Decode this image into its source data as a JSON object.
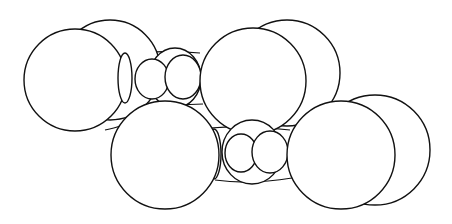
{
  "diagram": {
    "type": "space-filling molecular model (line drawing)",
    "canvas": {
      "width": 452,
      "height": 224,
      "background": "#ffffff",
      "stroke": "#111111"
    },
    "shapes": [
      {
        "id": "top-left-back-sphere",
        "kind": "circle",
        "cx": 110,
        "cy": 70,
        "r": 50
      },
      {
        "id": "top-left-front-sphere",
        "kind": "circle",
        "cx": 75,
        "cy": 80,
        "r": 51
      },
      {
        "id": "top-bridge-back",
        "kind": "ellipse",
        "cx": 175,
        "cy": 78,
        "rx": 26,
        "ry": 30
      },
      {
        "id": "top-ring-ellipse",
        "kind": "ellipse",
        "cx": 125,
        "cy": 78,
        "rx": 7,
        "ry": 25
      },
      {
        "id": "top-small-sphere-1",
        "kind": "ellipse",
        "cx": 152,
        "cy": 79,
        "rx": 17,
        "ry": 20
      },
      {
        "id": "top-small-sphere-2",
        "kind": "ellipse",
        "cx": 183,
        "cy": 77,
        "rx": 18,
        "ry": 22
      },
      {
        "id": "top-right-back-sphere",
        "kind": "circle",
        "cx": 287,
        "cy": 73,
        "r": 53
      },
      {
        "id": "top-right-front-sphere",
        "kind": "circle",
        "cx": 253,
        "cy": 81,
        "r": 53
      },
      {
        "id": "bottom-right-back-sphere",
        "kind": "circle",
        "cx": 375,
        "cy": 150,
        "r": 55
      },
      {
        "id": "bottom-bridge-back",
        "kind": "ellipse",
        "cx": 252,
        "cy": 152,
        "rx": 30,
        "ry": 32
      },
      {
        "id": "bottom-ring-ellipse",
        "kind": "ellipse",
        "cx": 214,
        "cy": 154,
        "rx": 7,
        "ry": 25
      },
      {
        "id": "bottom-small-sphere-1",
        "kind": "ellipse",
        "cx": 241,
        "cy": 153,
        "rx": 16,
        "ry": 19
      },
      {
        "id": "bottom-small-sphere-2",
        "kind": "ellipse",
        "cx": 270,
        "cy": 152,
        "rx": 18,
        "ry": 21
      },
      {
        "id": "bottom-left-sphere",
        "kind": "circle",
        "cx": 165,
        "cy": 155,
        "r": 54
      },
      {
        "id": "bottom-right-front-sphere",
        "kind": "circle",
        "cx": 341,
        "cy": 155,
        "r": 54
      }
    ],
    "connectors": [
      {
        "id": "top-link-upper",
        "d": "M 121 54 Q 160 50 200 53"
      },
      {
        "id": "top-link-lower",
        "d": "M 127 102 Q 165 106 203 104"
      },
      {
        "id": "lower-left-link",
        "d": "M 105 130 Q 115 128 120 126"
      },
      {
        "id": "bottom-link-upper",
        "d": "M 210 128 Q 250 125 290 130"
      },
      {
        "id": "bottom-link-lower",
        "d": "M 215 180 Q 250 185 292 178"
      }
    ]
  }
}
